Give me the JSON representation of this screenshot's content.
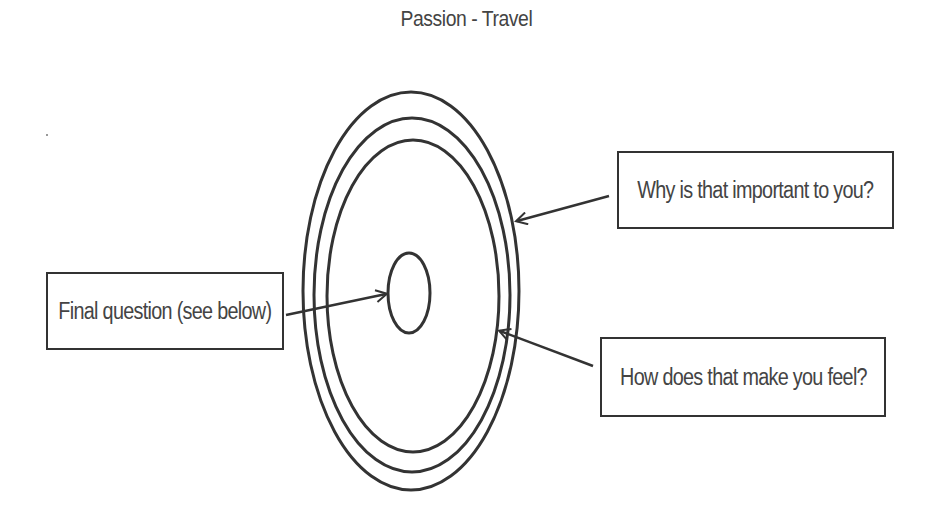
{
  "title": "Passion - Travel",
  "diagram": {
    "type": "concentric-ellipses",
    "rings": [
      {
        "name": "outer-ring",
        "cx": 411,
        "cy": 291,
        "rx": 108,
        "ry": 199
      },
      {
        "name": "middle-ring",
        "cx": 412,
        "cy": 295,
        "rx": 98,
        "ry": 177
      },
      {
        "name": "inner-ring",
        "cx": 413,
        "cy": 296,
        "rx": 86,
        "ry": 156
      },
      {
        "name": "core-ring",
        "cx": 409,
        "cy": 293,
        "rx": 21,
        "ry": 40
      }
    ],
    "stroke_color": "#333333"
  },
  "boxes": {
    "why": {
      "label": "Why is that important to you?",
      "points_to": "outer-ring"
    },
    "how": {
      "label": "How does that make you feel?",
      "points_to": "middle-ring"
    },
    "final": {
      "label": "Final question (see below)",
      "points_to": "core-ring"
    }
  }
}
